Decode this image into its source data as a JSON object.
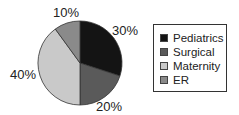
{
  "chart_data": {
    "type": "pie",
    "title": "",
    "categories": [
      "Pediatrics",
      "Surgical",
      "Maternity",
      "ER"
    ],
    "values": [
      30,
      20,
      40,
      10
    ],
    "labels": [
      "30%",
      "20%",
      "40%",
      "10%"
    ],
    "colors": [
      "#141414",
      "#5a5a5a",
      "#c9c9c9",
      "#8a8a8a"
    ],
    "start_angle_deg": 0,
    "direction": "clockwise-from-top",
    "legend_position": "right"
  },
  "legend": {
    "items": [
      {
        "label": "Pediatrics",
        "color": "#141414"
      },
      {
        "label": "Surgical",
        "color": "#5a5a5a"
      },
      {
        "label": "Maternity",
        "color": "#c9c9c9"
      },
      {
        "label": "ER",
        "color": "#8a8a8a"
      }
    ]
  },
  "slice_labels": {
    "pediatrics": "30%",
    "surgical": "20%",
    "maternity": "40%",
    "er": "10%"
  }
}
